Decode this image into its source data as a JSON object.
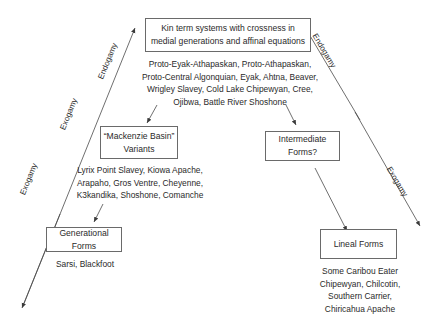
{
  "diagram": {
    "nodes": {
      "top": {
        "title_line1": "Kin term systems with crossness in",
        "title_line2": "medial generations and affinal equations",
        "members": [
          "Proto-Eyak-Athapaskan, Proto-Athapaskan,",
          "Proto-Central Algonquian, Eyak, Ahtna, Beaver,",
          "Wrigley Slavey, Cold Lake Chipewyan, Cree,",
          "Ojibwa, Battle River Shoshone"
        ]
      },
      "mackenzie": {
        "title_line1": "“Mackenzie Basin”",
        "title_line2": "Variants",
        "members": [
          "Lyrix Point Slavey, Kiowa Apache,",
          "Arapaho, Gros Ventre, Cheyenne,",
          "K3kandika, Shoshone, Comanche"
        ]
      },
      "intermediate": {
        "title": "Intermediate Forms?"
      },
      "generational": {
        "title": "Generational Forms",
        "members": [
          "Sarsi, Blackfoot"
        ]
      },
      "lineal": {
        "title": "Lineal Forms",
        "members": [
          "Some Caribou Eater",
          "Chipewyan, Chilcotin,",
          "Southern Carrier,",
          "Chiricahua Apache"
        ]
      }
    },
    "axes": {
      "left_upper": "Endogamy",
      "left_middle": "Exogamy",
      "left_lower": "Exogamy",
      "right_upper": "Endogamy",
      "right_lower": "Exogamy"
    },
    "colors": {
      "line": "#4a4a4a",
      "box_border": "#6a6a6a",
      "text": "#2a2a2a"
    }
  }
}
